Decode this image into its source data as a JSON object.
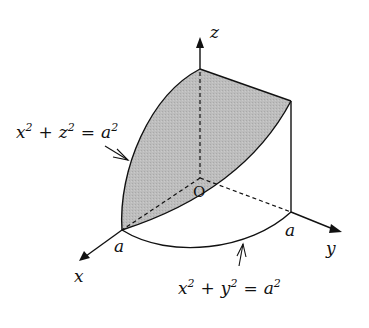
{
  "diagram": {
    "type": "3d-solid-region",
    "axes": {
      "x_label": "x",
      "y_label": "y",
      "z_label": "z",
      "origin_label": "O"
    },
    "tick_labels": {
      "x_intercept": "a",
      "y_intercept": "a"
    },
    "surfaces": {
      "cylinder_xz": {
        "base": "x² + z² = a",
        "sup": "2"
      },
      "cylinder_xy": {
        "base": "x² + y² = a",
        "sup": "2"
      }
    },
    "equations": {
      "xz": {
        "x": "x",
        "z": "z",
        "a": "a",
        "two": "2",
        "plus": "+",
        "eq": "="
      },
      "xy": {
        "x": "x",
        "y": "y",
        "a": "a",
        "two": "2",
        "plus": "+",
        "eq": "="
      }
    },
    "colors": {
      "shade": "#b8b8b8",
      "stroke": "#111111",
      "background": "#ffffff"
    }
  }
}
